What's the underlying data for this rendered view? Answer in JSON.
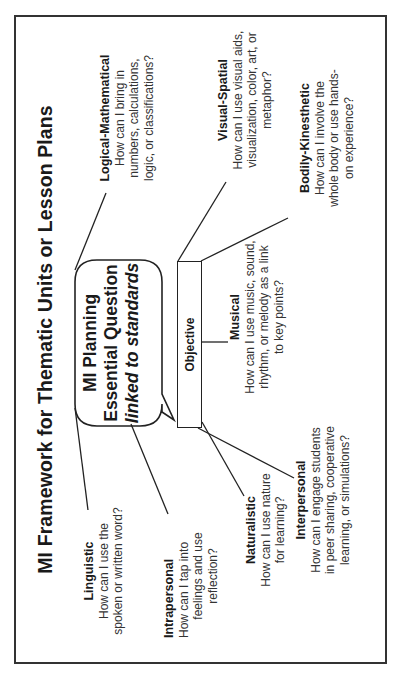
{
  "title": "MI Framework for Thematic Units or Lesson Plans",
  "center": {
    "bubble": {
      "line1": "MI Planning",
      "line2": "Essential Question",
      "line3": "linked to standards"
    },
    "objective_label": "Objective"
  },
  "intelligences": [
    {
      "id": "logical-mathematical",
      "name": "Logical-Mathematical",
      "lines": [
        "How can I bring in",
        "numbers, calculations,",
        "logic, or classifications?"
      ]
    },
    {
      "id": "visual-spatial",
      "name": "Visual-Spatial",
      "lines": [
        "How can I use visual aids,",
        "visualization, color, art, or",
        "metaphor?"
      ]
    },
    {
      "id": "bodily-kinesthetic",
      "name": "Bodily-Kinesthetic",
      "lines": [
        "How can I involve the",
        "whole body or use hands-",
        "on experience?"
      ]
    },
    {
      "id": "musical",
      "name": "Musical",
      "lines": [
        "How can I use music, sound,",
        "rhythm, or melody as a link",
        "to key points?"
      ]
    },
    {
      "id": "interpersonal",
      "name": "Interpersonal",
      "lines": [
        "How can I engage students",
        "in peer sharing, cooperative",
        "learning, or simulations?"
      ]
    },
    {
      "id": "naturalistic",
      "name": "Naturalistic",
      "lines": [
        "How can I use nature",
        "for learning?"
      ]
    },
    {
      "id": "intrapersonal",
      "name": "Intrapersonal",
      "lines": [
        "How can I tap into",
        "feelings and use",
        "reflection?"
      ]
    },
    {
      "id": "linguistic",
      "name": "Linguistic",
      "lines": [
        "How can I use the",
        "spoken or written word?"
      ]
    }
  ],
  "colors": {
    "stroke": "#222222",
    "text": "#1a1a1a",
    "border": "#333333",
    "background": "#ffffff"
  }
}
